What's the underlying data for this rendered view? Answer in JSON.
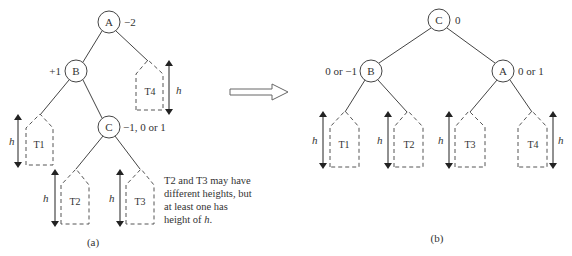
{
  "diagram_a": {
    "caption": "(a)",
    "nodes": [
      {
        "id": "A",
        "label": "A",
        "balance": "−2"
      },
      {
        "id": "B",
        "label": "B",
        "balance": "+1"
      },
      {
        "id": "C",
        "label": "C",
        "balance": "−1, 0 or 1"
      }
    ],
    "subtrees": [
      {
        "id": "T1",
        "label": "T1",
        "height_label": "h"
      },
      {
        "id": "T2",
        "label": "T2",
        "height_label": "h"
      },
      {
        "id": "T3",
        "label": "T3",
        "height_label": "h"
      },
      {
        "id": "T4",
        "label": "T4",
        "height_label": "h"
      }
    ],
    "note_lines": [
      "T2 and T3 may have",
      "different heights, but",
      "at least one has",
      "height of "
    ],
    "note_italic": "h",
    "note_end": "."
  },
  "transition_arrow": "hollow-right-arrow",
  "diagram_b": {
    "caption": "(b)",
    "nodes": [
      {
        "id": "C",
        "label": "C",
        "balance": "0"
      },
      {
        "id": "B",
        "label": "B",
        "balance": "0 or −1"
      },
      {
        "id": "A",
        "label": "A",
        "balance": "0 or 1"
      }
    ],
    "subtrees": [
      {
        "id": "T1",
        "label": "T1",
        "height_label": "h"
      },
      {
        "id": "T2",
        "label": "T2",
        "height_label": "h"
      },
      {
        "id": "T3",
        "label": "T3",
        "height_label": "h"
      },
      {
        "id": "T4",
        "label": "T4",
        "height_label": "h"
      }
    ]
  }
}
